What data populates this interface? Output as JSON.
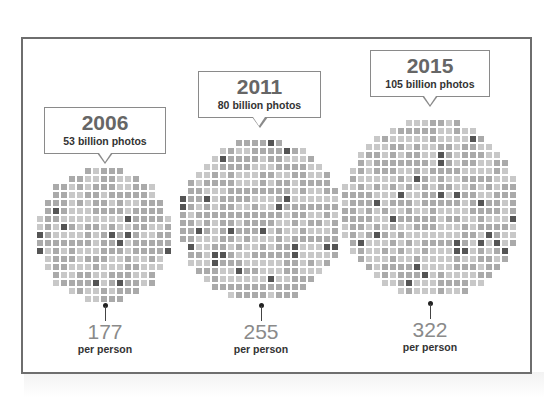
{
  "chart_data": {
    "type": "bubble-pictogram",
    "title": "",
    "unit_label": "per person",
    "categories": [
      "2006",
      "2011",
      "2015"
    ],
    "series": [
      {
        "name": "Photos taken (billions)",
        "values": [
          53,
          80,
          105
        ]
      },
      {
        "name": "Photos per person",
        "values": [
          177,
          255,
          322
        ]
      }
    ],
    "items": [
      {
        "year": "2006",
        "photos": "53 billion photos",
        "per_person": "177",
        "per_person_label": "per person"
      },
      {
        "year": "2011",
        "photos": "80 billion photos",
        "per_person": "255",
        "per_person_label": "per person"
      },
      {
        "year": "2015",
        "photos": "105 billion photos",
        "per_person": "322",
        "per_person_label": "per person"
      }
    ]
  },
  "colors": {
    "frame": "#6e6e6e",
    "square_light": "#c8c8c8",
    "square_mid": "#aaaaaa",
    "square_dark": "#555555",
    "number": "#8a8a8a",
    "year": "#666666"
  }
}
